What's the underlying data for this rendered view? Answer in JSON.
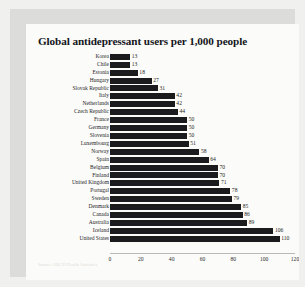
{
  "card": {
    "source_note": "Source: OECD Health Statistics"
  },
  "chart_data": {
    "type": "bar",
    "orientation": "horizontal",
    "title": "Global antidepressant users per 1,000 people",
    "xlabel": "",
    "ylabel": "",
    "xlim": [
      0,
      120
    ],
    "xticks": [
      0,
      20,
      40,
      60,
      80,
      100,
      120
    ],
    "xtick_labels": [
      "0",
      "20",
      "40",
      "60",
      "80",
      "100",
      "120"
    ],
    "grid": false,
    "legend": null,
    "bar_color": "#1b1b1d",
    "value_labels_shown": true,
    "categories": [
      "Korea",
      "Chile",
      "Estonia",
      "Hungary",
      "Slovak Republic",
      "Italy",
      "Netherlands",
      "Czech Republic",
      "France",
      "Germany",
      "Slovenia",
      "Luxembourg",
      "Norway",
      "Spain",
      "Belgium",
      "Finland",
      "United Kingdom",
      "Portugal",
      "Sweden",
      "Denmark",
      "Canada",
      "Australia",
      "Iceland",
      "United States"
    ],
    "values": [
      13,
      13,
      18,
      27,
      31,
      42,
      42,
      44,
      50,
      50,
      50,
      51,
      58,
      64,
      70,
      70,
      71,
      78,
      79,
      85,
      86,
      89,
      106,
      110
    ]
  }
}
